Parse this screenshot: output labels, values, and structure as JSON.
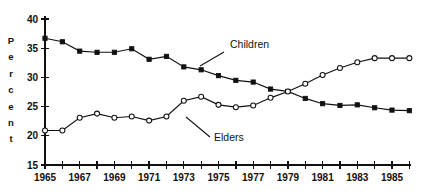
{
  "chart_data": {
    "type": "line",
    "title": "",
    "xlabel": "",
    "ylabel": "Percent",
    "ylabel_letters": [
      "P",
      "e",
      "r",
      "c",
      "e",
      "n",
      "t"
    ],
    "xlim": [
      1965,
      1986
    ],
    "ylim": [
      15,
      40
    ],
    "yticks": [
      15,
      20,
      25,
      30,
      35,
      40
    ],
    "ytick_labels": [
      "15",
      "20",
      "25",
      "30",
      "35",
      "40"
    ],
    "x": [
      1965,
      1966,
      1967,
      1968,
      1969,
      1970,
      1971,
      1972,
      1973,
      1974,
      1975,
      1976,
      1977,
      1978,
      1979,
      1980,
      1981,
      1982,
      1983,
      1984,
      1985,
      1986
    ],
    "xtick_labels": [
      "1965",
      "",
      "1967",
      "",
      "1969",
      "",
      "1971",
      "",
      "1973",
      "",
      "1975",
      "",
      "1977",
      "",
      "1979",
      "",
      "1981",
      "",
      "1983",
      "",
      "1985",
      ""
    ],
    "xtick_labels_shown": [
      "1965",
      "1967",
      "1969",
      "1971",
      "1973",
      "1975",
      "1977",
      "1979",
      "1981",
      "1983",
      "1985"
    ],
    "grid": false,
    "legend_position": "inline-annotation",
    "series": [
      {
        "name": "Children",
        "marker": "filled-square",
        "values": [
          36.7,
          36.1,
          34.5,
          34.3,
          34.3,
          34.9,
          33.1,
          33.6,
          31.8,
          31.3,
          30.3,
          29.5,
          29.2,
          28.0,
          27.6,
          26.4,
          25.5,
          25.2,
          25.3,
          24.8,
          24.4,
          24.3
        ]
      },
      {
        "name": "Elders",
        "marker": "open-circle",
        "values": [
          20.9,
          20.9,
          23.1,
          23.8,
          23.1,
          23.3,
          22.6,
          23.3,
          26.0,
          26.7,
          25.3,
          24.9,
          25.2,
          26.5,
          27.6,
          28.9,
          30.4,
          31.6,
          32.6,
          33.3,
          33.3,
          33.3
        ]
      }
    ],
    "annotations": [
      {
        "name": "Children",
        "label_x": 230,
        "label_y": 48,
        "leader_from_x": 224,
        "leader_from_y": 52,
        "leader_to_x": 200,
        "leader_to_y": 66
      },
      {
        "name": "Elders",
        "label_x": 214,
        "label_y": 141,
        "leader_from_x": 210,
        "leader_from_y": 137,
        "leader_to_x": 186,
        "leader_to_y": 117
      }
    ],
    "colors": {
      "line": "#111111",
      "marker_filled": "#111111",
      "marker_open_fill": "#ffffff",
      "background": "#ffffff",
      "axis": "#111111"
    }
  }
}
